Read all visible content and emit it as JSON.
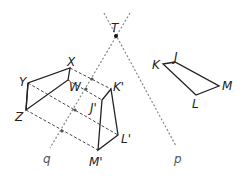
{
  "diagram": {
    "intersection_point": {
      "label": "T"
    },
    "lines": [
      {
        "label": "p"
      },
      {
        "label": "q"
      }
    ],
    "original_figure": {
      "vertices": [
        "J",
        "K",
        "L",
        "M"
      ]
    },
    "first_image": {
      "vertices": [
        "J'",
        "K'",
        "L'",
        "M'"
      ]
    },
    "second_image": {
      "vertices": [
        "W",
        "X",
        "Y",
        "Z"
      ]
    }
  }
}
